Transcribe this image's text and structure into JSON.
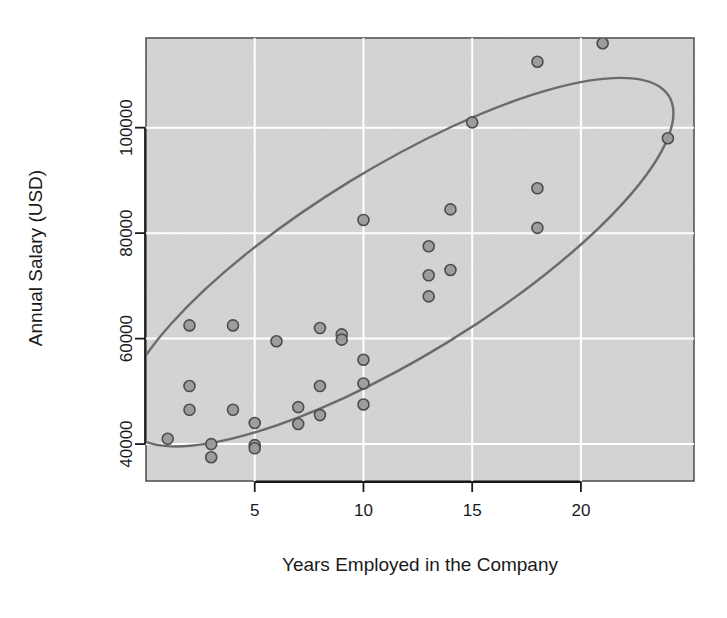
{
  "chart_data": {
    "type": "scatter",
    "title": "",
    "xlabel": "Years Employed in the Company",
    "ylabel": "Annual Salary (USD)",
    "xlim": [
      0,
      25.2
    ],
    "ylim": [
      33000,
      117000
    ],
    "xticks": [
      5,
      10,
      15,
      20
    ],
    "xtick_labels": [
      "5",
      "10",
      "15",
      "20"
    ],
    "yticks": [
      40000,
      60000,
      80000,
      100000
    ],
    "ytick_labels": [
      "40000",
      "60000",
      "80000",
      "100000"
    ],
    "grid": true,
    "grid_color": "#ffffff",
    "panel_background": "#d4d4d4",
    "point_fill": "#9a9a9a",
    "point_stroke": "#4d4d4d",
    "point_radius": 5.5,
    "ellipse": {
      "description": "95% concentration ellipse overlay",
      "stroke": "#6b6b6b",
      "fill": "none",
      "center_x": 11.6,
      "center_y": 74500,
      "semi_major": 14.6,
      "semi_minor": 4.15,
      "rotation_deg": -31.5
    },
    "legend": null,
    "points": [
      {
        "x": 1,
        "y": 41000
      },
      {
        "x": 2,
        "y": 62500
      },
      {
        "x": 2,
        "y": 51000
      },
      {
        "x": 2,
        "y": 46500
      },
      {
        "x": 3,
        "y": 40000
      },
      {
        "x": 3,
        "y": 37500
      },
      {
        "x": 4,
        "y": 62500
      },
      {
        "x": 4,
        "y": 46500
      },
      {
        "x": 5,
        "y": 44000
      },
      {
        "x": 5,
        "y": 39800
      },
      {
        "x": 5,
        "y": 39200
      },
      {
        "x": 6,
        "y": 59500
      },
      {
        "x": 7,
        "y": 47000
      },
      {
        "x": 7,
        "y": 43800
      },
      {
        "x": 8,
        "y": 62000
      },
      {
        "x": 8,
        "y": 51000
      },
      {
        "x": 8,
        "y": 45500
      },
      {
        "x": 9,
        "y": 60800
      },
      {
        "x": 9,
        "y": 59800
      },
      {
        "x": 10,
        "y": 82500
      },
      {
        "x": 10,
        "y": 56000
      },
      {
        "x": 10,
        "y": 51500
      },
      {
        "x": 10,
        "y": 47500
      },
      {
        "x": 13,
        "y": 77500
      },
      {
        "x": 13,
        "y": 72000
      },
      {
        "x": 13,
        "y": 68000
      },
      {
        "x": 14,
        "y": 84500
      },
      {
        "x": 14,
        "y": 73000
      },
      {
        "x": 15,
        "y": 101000
      },
      {
        "x": 18,
        "y": 112500
      },
      {
        "x": 18,
        "y": 88500
      },
      {
        "x": 18,
        "y": 81000
      },
      {
        "x": 21,
        "y": 116000
      },
      {
        "x": 24,
        "y": 98000
      }
    ]
  },
  "figure": {
    "axis_title_x": "Years Employed in the Company",
    "axis_title_y": "Annual Salary (USD)"
  }
}
